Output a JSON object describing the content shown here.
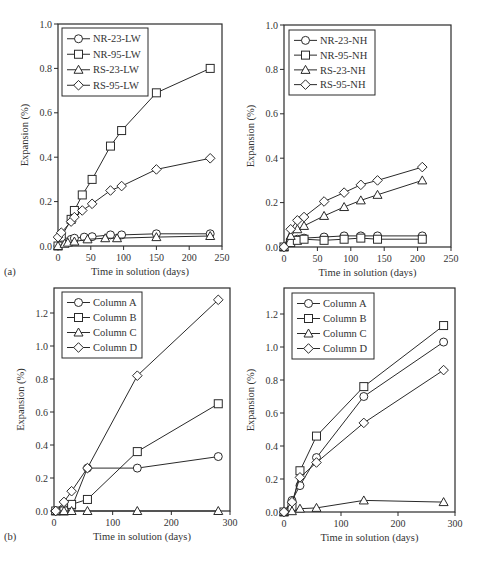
{
  "figure": {
    "panel_labels": [
      "(a)",
      "(b)"
    ]
  },
  "chart_data": [
    {
      "id": "a-left",
      "type": "line",
      "title": "",
      "xlabel": "Time in solution (days)",
      "ylabel": "Expansion (%)",
      "xlim": [
        0,
        250
      ],
      "ylim": [
        0,
        1.0
      ],
      "xticks": [
        0,
        50,
        100,
        150,
        200,
        250
      ],
      "yticks": [
        0.0,
        0.2,
        0.4,
        0.6,
        0.8,
        1.0
      ],
      "ytick_labels": [
        "0.0",
        "0.2",
        "0.4",
        "0.6",
        "0.8",
        "1.0"
      ],
      "grid": false,
      "legend_position": "upper left",
      "panel_label": "(a)",
      "frame": {
        "x0": 58,
        "x1": 222,
        "y0": 246,
        "y1": 24,
        "top": 24
      },
      "legend": {
        "x": 62,
        "y": 28,
        "w": 86,
        "h": 68
      },
      "series": [
        {
          "name": "NR-23-LW",
          "marker": "circle",
          "x": [
            0,
            10,
            20,
            25,
            40,
            52,
            80,
            97,
            150,
            232
          ],
          "y": [
            0.0,
            0.02,
            0.03,
            0.035,
            0.04,
            0.042,
            0.05,
            0.05,
            0.055,
            0.055
          ]
        },
        {
          "name": "NR-95-LW",
          "marker": "square",
          "x": [
            0,
            5,
            20,
            25,
            37,
            52,
            80,
            97,
            150,
            232
          ],
          "y": [
            0.0,
            0.04,
            0.12,
            0.16,
            0.23,
            0.3,
            0.45,
            0.52,
            0.69,
            0.8
          ]
        },
        {
          "name": "RS-23-LW",
          "marker": "triangle",
          "x": [
            0,
            10,
            15,
            25,
            45,
            72,
            90,
            150,
            232
          ],
          "y": [
            0.0,
            0.01,
            0.015,
            0.02,
            0.03,
            0.035,
            0.035,
            0.04,
            0.045
          ]
        },
        {
          "name": "RS-95-LW",
          "marker": "diamond",
          "x": [
            0,
            5,
            20,
            25,
            37,
            52,
            80,
            97,
            150,
            232
          ],
          "y": [
            0.04,
            0.06,
            0.11,
            0.13,
            0.16,
            0.19,
            0.25,
            0.27,
            0.345,
            0.395
          ]
        }
      ]
    },
    {
      "id": "a-right",
      "type": "line",
      "title": "",
      "xlabel": "Time in solution (days)",
      "ylabel": "Expansion (%)",
      "xlim": [
        0,
        250
      ],
      "ylim": [
        0,
        1.0
      ],
      "xticks": [
        0,
        50,
        100,
        150,
        200,
        250
      ],
      "yticks": [
        0.0,
        0.2,
        0.4,
        0.6,
        0.8,
        1.0
      ],
      "ytick_labels": [
        "0.0",
        "0.2",
        "0.4",
        "0.6",
        "0.8",
        "1.0"
      ],
      "grid": false,
      "legend_position": "upper left",
      "panel_label": "",
      "frame": {
        "x0": 284,
        "x1": 451,
        "y0": 247,
        "y1": 25,
        "top": 25
      },
      "legend": {
        "x": 289,
        "y": 30,
        "w": 86,
        "h": 65
      },
      "series": [
        {
          "name": "NR-23-NH",
          "marker": "circle",
          "x": [
            0,
            10,
            20,
            30,
            60,
            90,
            115,
            140,
            207
          ],
          "y": [
            0.0,
            0.02,
            0.035,
            0.04,
            0.045,
            0.05,
            0.05,
            0.05,
            0.05
          ]
        },
        {
          "name": "NR-95-NH",
          "marker": "square",
          "x": [
            0,
            10,
            20,
            30,
            60,
            90,
            115,
            140,
            207
          ],
          "y": [
            0.0,
            0.02,
            0.03,
            0.035,
            0.03,
            0.035,
            0.04,
            0.035,
            0.035
          ]
        },
        {
          "name": "RS-23-NH",
          "marker": "triangle",
          "x": [
            0,
            10,
            20,
            30,
            60,
            90,
            115,
            140,
            207
          ],
          "y": [
            0.0,
            0.05,
            0.08,
            0.095,
            0.14,
            0.18,
            0.21,
            0.235,
            0.3
          ]
        },
        {
          "name": "RS-95-NH",
          "marker": "diamond",
          "x": [
            0,
            10,
            20,
            30,
            60,
            90,
            115,
            140,
            207
          ],
          "y": [
            0.0,
            0.08,
            0.12,
            0.135,
            0.205,
            0.245,
            0.28,
            0.3,
            0.36
          ]
        }
      ]
    },
    {
      "id": "b-left",
      "type": "line",
      "title": "",
      "xlabel": "Time in solution (days)",
      "ylabel": "Expansion (%)",
      "xlim": [
        0,
        300
      ],
      "ylim": [
        0,
        1.3
      ],
      "xticks": [
        0,
        100,
        200,
        300
      ],
      "yticks": [
        0.0,
        0.2,
        0.4,
        0.6,
        0.8,
        1.0,
        1.2
      ],
      "ytick_labels": [
        "0.0",
        "0.2",
        "0.4",
        "0.6",
        "0.8",
        "1.0",
        "1.2"
      ],
      "grid": false,
      "legend_position": "upper left",
      "panel_label": "(b)",
      "frame": {
        "x0": 54,
        "x1": 230,
        "y0": 511,
        "y1": 313,
        "y1val": 1.2,
        "top": 288
      },
      "legend": {
        "x": 62,
        "y": 292,
        "w": 80,
        "h": 66
      },
      "series": [
        {
          "name": "Column A",
          "marker": "circle",
          "x": [
            3,
            17,
            30,
            57,
            142,
            280
          ],
          "y": [
            0.0,
            0.01,
            0.02,
            0.26,
            0.26,
            0.33
          ]
        },
        {
          "name": "Column B",
          "marker": "square",
          "x": [
            3,
            17,
            30,
            57,
            142,
            280
          ],
          "y": [
            0.0,
            0.0,
            0.04,
            0.07,
            0.36,
            0.65
          ]
        },
        {
          "name": "Column C",
          "marker": "triangle",
          "x": [
            3,
            17,
            30,
            57,
            142,
            280
          ],
          "y": [
            0.0,
            0.0,
            0.0,
            0.0,
            0.0,
            0.0
          ]
        },
        {
          "name": "Column D",
          "marker": "diamond",
          "x": [
            3,
            17,
            30,
            57,
            142,
            280
          ],
          "y": [
            0.0,
            0.055,
            0.12,
            0.26,
            0.82,
            1.28
          ]
        }
      ]
    },
    {
      "id": "b-right",
      "type": "line",
      "title": "",
      "xlabel": "Time in solution (days)",
      "ylabel": "Expansion (%)",
      "xlim": [
        0,
        300
      ],
      "ylim": [
        0,
        1.3
      ],
      "xticks": [
        0,
        100,
        200,
        300
      ],
      "yticks": [
        0.0,
        0.2,
        0.4,
        0.6,
        0.8,
        1.0,
        1.2
      ],
      "ytick_labels": [
        "0.0",
        "0.2",
        "0.4",
        "0.6",
        "0.8",
        "1.0",
        "1.2"
      ],
      "grid": false,
      "legend_position": "upper left",
      "panel_label": "",
      "frame": {
        "x0": 284,
        "x1": 455,
        "y0": 512,
        "y1": 314,
        "y1val": 1.2,
        "top": 288
      },
      "legend": {
        "x": 292,
        "y": 293,
        "w": 82,
        "h": 66
      },
      "series": [
        {
          "name": "Column A",
          "marker": "circle",
          "x": [
            0,
            14,
            28,
            57,
            140,
            280
          ],
          "y": [
            0.0,
            0.07,
            0.16,
            0.33,
            0.7,
            1.03
          ]
        },
        {
          "name": "Column B",
          "marker": "square",
          "x": [
            0,
            14,
            28,
            57,
            140,
            280
          ],
          "y": [
            0.0,
            0.03,
            0.25,
            0.46,
            0.76,
            1.13
          ]
        },
        {
          "name": "Column C",
          "marker": "triangle",
          "x": [
            0,
            14,
            28,
            57,
            140,
            280
          ],
          "y": [
            0.0,
            0.005,
            0.02,
            0.025,
            0.07,
            0.06
          ]
        },
        {
          "name": "Column D",
          "marker": "diamond",
          "x": [
            0,
            14,
            28,
            57,
            140,
            280
          ],
          "y": [
            0.0,
            0.06,
            0.21,
            0.3,
            0.54,
            0.86
          ]
        }
      ]
    }
  ]
}
